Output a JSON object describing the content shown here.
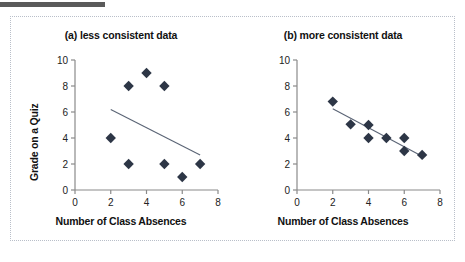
{
  "figure": {
    "top_bar_color": "#5a5a5a",
    "frame_border_color": "#b9bfc9",
    "marker_color": "#2d3646",
    "line_color": "#5a6475",
    "axis_color": "#8a8a8a"
  },
  "chart_data": [
    {
      "type": "scatter",
      "title": "(a) less consistent data",
      "xlabel": "Number of Class Absences",
      "ylabel": "Grade on a Quiz",
      "xlim": [
        0,
        8
      ],
      "ylim": [
        0,
        10
      ],
      "xticks": [
        0,
        2,
        4,
        6,
        8
      ],
      "yticks": [
        0,
        2,
        4,
        6,
        8,
        10
      ],
      "grid": false,
      "legend": "none",
      "points": [
        {
          "x": 2,
          "y": 4
        },
        {
          "x": 3,
          "y": 8
        },
        {
          "x": 3,
          "y": 2
        },
        {
          "x": 4,
          "y": 9
        },
        {
          "x": 5,
          "y": 8
        },
        {
          "x": 5,
          "y": 2
        },
        {
          "x": 6,
          "y": 1
        },
        {
          "x": 7,
          "y": 2
        }
      ],
      "trendline": {
        "x1": 2.0,
        "y1": 6.2,
        "x2": 7.0,
        "y2": 2.7
      }
    },
    {
      "type": "scatter",
      "title": "(b) more consistent data",
      "xlabel": "Number of Class Absences",
      "ylabel": "",
      "xlim": [
        0,
        8
      ],
      "ylim": [
        0,
        10
      ],
      "xticks": [
        0,
        2,
        4,
        6,
        8
      ],
      "yticks": [
        0,
        2,
        4,
        6,
        8,
        10
      ],
      "grid": false,
      "legend": "none",
      "points": [
        {
          "x": 2,
          "y": 6.8
        },
        {
          "x": 3,
          "y": 5.05
        },
        {
          "x": 4,
          "y": 5.0
        },
        {
          "x": 4,
          "y": 4.0
        },
        {
          "x": 5,
          "y": 4.0
        },
        {
          "x": 6,
          "y": 4.0
        },
        {
          "x": 6,
          "y": 3.0
        },
        {
          "x": 7,
          "y": 2.7
        }
      ],
      "trendline": {
        "x1": 2.0,
        "y1": 6.25,
        "x2": 7.0,
        "y2": 2.6
      }
    }
  ]
}
